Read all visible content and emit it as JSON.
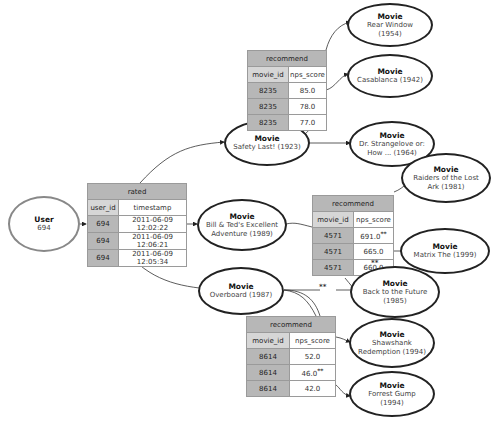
{
  "user": {
    "kind": "User",
    "id": "694"
  },
  "rated": {
    "title": "rated",
    "columns": [
      "user_id",
      "timestamp"
    ],
    "rows": [
      [
        "694",
        "2011-06-09 12:02:22"
      ],
      [
        "694",
        "2011-06-09 12:06:21"
      ],
      [
        "694",
        "2011-06-09 12:05:34"
      ]
    ]
  },
  "rated_movies": [
    {
      "kind": "Movie",
      "title": "Safety Last! (1923)"
    },
    {
      "kind": "Movie",
      "title": "Bill & Ted's Excellent Adventure (1989)"
    },
    {
      "kind": "Movie",
      "title": "Overboard (1987)"
    }
  ],
  "recommend_tables": [
    {
      "title": "recommend",
      "columns": [
        "movie_id",
        "nps_score"
      ],
      "rows": [
        [
          "8235",
          "85.0"
        ],
        [
          "8235",
          "78.0"
        ],
        [
          "8235",
          "77.0"
        ]
      ]
    },
    {
      "title": "recommend",
      "columns": [
        "movie_id",
        "nps_score"
      ],
      "rows": [
        [
          "4571",
          "691.0",
          "**"
        ],
        [
          "4571",
          "665.0",
          ""
        ],
        [
          "4571",
          "660.0",
          ""
        ]
      ]
    },
    {
      "title": "recommend",
      "columns": [
        "movie_id",
        "nps_score"
      ],
      "rows": [
        [
          "8614",
          "52.0",
          ""
        ],
        [
          "8614",
          "46.0",
          "**"
        ],
        [
          "8614",
          "42.0",
          ""
        ]
      ]
    }
  ],
  "recommended_movies": [
    {
      "kind": "Movie",
      "title": "Rear Window (1954)"
    },
    {
      "kind": "Movie",
      "title": "Casablanca (1942)"
    },
    {
      "kind": "Movie",
      "title": "Dr. Strangelove or: How ... (1964)"
    },
    {
      "kind": "Movie",
      "title": "Raiders of the Lost Ark (1981)"
    },
    {
      "kind": "Movie",
      "title": "Matrix The (1999)"
    },
    {
      "kind": "Movie",
      "title": "Back to the Future (1985)"
    },
    {
      "kind": "Movie",
      "title": "Shawshank Redemption (1994)"
    },
    {
      "kind": "Movie",
      "title": "Forrest Gump (1994)"
    }
  ],
  "annotations": {
    "star": "**"
  }
}
